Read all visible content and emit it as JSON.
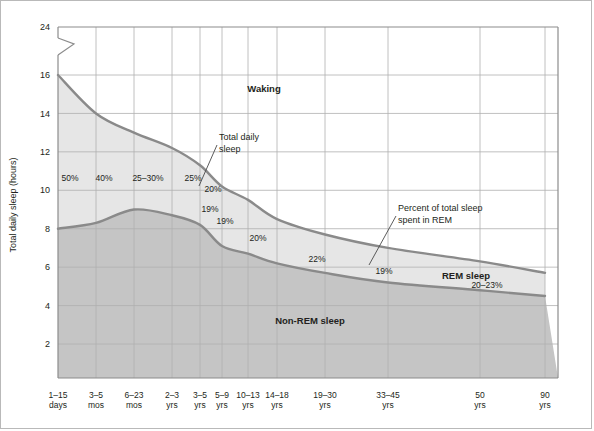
{
  "chart_data": {
    "type": "area",
    "title": "",
    "xlabel": "",
    "ylabel": "Total daily sleep (hours)",
    "ylim": [
      0,
      24
    ],
    "y_ticks": [
      24,
      16,
      14,
      12,
      10,
      8,
      6,
      4,
      2
    ],
    "y_axis_break": {
      "between": [
        16,
        24
      ],
      "symbol": "zigzag"
    },
    "grid": true,
    "legend_position": "inline-annotations",
    "categories": [
      "1–15 days",
      "3–5 mos",
      "6–23 mos",
      "2–3 yrs",
      "3–5 yrs",
      "5–9 yrs",
      "10–13 yrs",
      "14–18 yrs",
      "19–30 yrs",
      "33–45 yrs",
      "50 yrs",
      "90 yrs"
    ],
    "x_tick_labels": [
      {
        "line1": "1–15",
        "line2": "days"
      },
      {
        "line1": "3–5",
        "line2": "mos"
      },
      {
        "line1": "6–23",
        "line2": "mos"
      },
      {
        "line1": "2–3",
        "line2": "yrs"
      },
      {
        "line1": "3–5",
        "line2": "yrs"
      },
      {
        "line1": "5–9",
        "line2": "yrs"
      },
      {
        "line1": "10–13",
        "line2": "yrs"
      },
      {
        "line1": "14–18",
        "line2": "yrs"
      },
      {
        "line1": "19–30",
        "line2": "yrs"
      },
      {
        "line1": "33–45",
        "line2": "yrs"
      },
      {
        "line1": "50",
        "line2": "yrs"
      },
      {
        "line1": "90",
        "line2": "yrs"
      }
    ],
    "series": [
      {
        "name": "Total daily sleep",
        "values": [
          16.0,
          14.0,
          13.0,
          12.2,
          11.3,
          10.2,
          9.5,
          8.5,
          7.7,
          7.0,
          6.3,
          5.7
        ]
      },
      {
        "name": "Non-REM sleep (REM lower boundary)",
        "values": [
          8.0,
          8.3,
          9.0,
          8.7,
          8.2,
          7.1,
          6.7,
          6.2,
          5.7,
          5.2,
          4.8,
          4.5
        ]
      }
    ],
    "rem_percent_labels": [
      {
        "text": "50%",
        "category": "1–15 days"
      },
      {
        "text": "40%",
        "category": "3–5 mos"
      },
      {
        "text": "25–30%",
        "category": "6–23 mos"
      },
      {
        "text": "25%",
        "category": "2–3 yrs"
      },
      {
        "text": "20%",
        "category": "3–5 yrs"
      },
      {
        "text": "19%",
        "category": "5–9 yrs"
      },
      {
        "text": "19%",
        "category": "10–13 yrs"
      },
      {
        "text": "20%",
        "category": "14–18 yrs"
      },
      {
        "text": "22%",
        "category": "19–30 yrs"
      },
      {
        "text": "19%",
        "category": "33–45 yrs"
      },
      {
        "text": "20–23%",
        "category": "50–90 yrs"
      }
    ],
    "band_labels": [
      {
        "text": "Waking",
        "region": "above total daily sleep curve"
      },
      {
        "text": "REM sleep",
        "region": "between curves, right side"
      },
      {
        "text": "Non-REM sleep",
        "region": "below lower curve"
      }
    ],
    "callouts": [
      {
        "line1": "Total daily",
        "line2": "sleep",
        "points_to": "upper curve"
      },
      {
        "line1": "Percent of total sleep",
        "line2": "spent in REM",
        "points_to": "19% label near 33–45 yrs"
      }
    ],
    "colors": {
      "waking_fill": "#ffffff",
      "rem_fill": "#e3e3e3",
      "nonrem_fill": "#c5c5c5",
      "curve_stroke": "#8a8a8a",
      "grid": "#b4b4b4",
      "axis": "#8c8c8c",
      "text": "#231f20",
      "frame": "#b9b9b9"
    }
  }
}
